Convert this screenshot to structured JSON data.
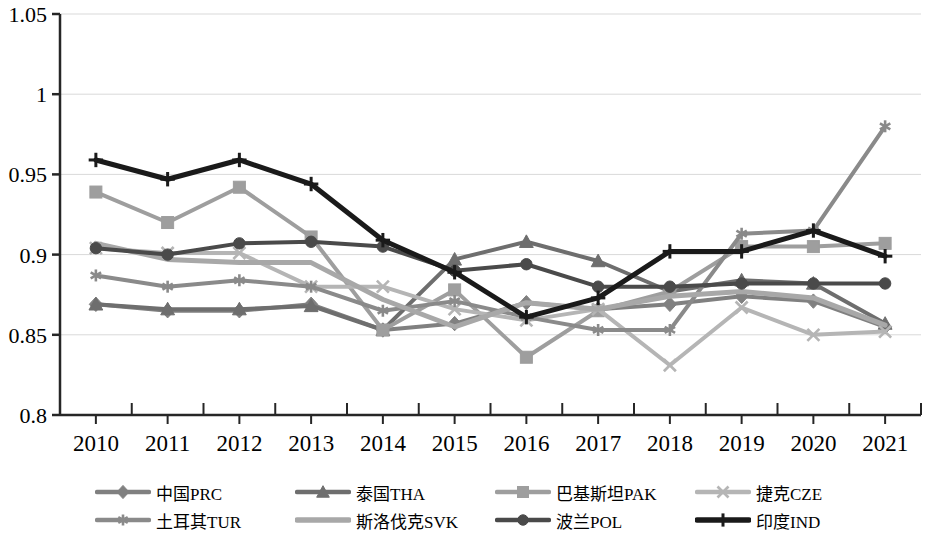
{
  "chart_data": {
    "type": "line",
    "title": "",
    "xlabel": "",
    "ylabel": "",
    "categories": [
      "2010",
      "2011",
      "2012",
      "2013",
      "2014",
      "2015",
      "2016",
      "2017",
      "2018",
      "2019",
      "2020",
      "2021"
    ],
    "ylim": [
      0.8,
      1.05
    ],
    "yticks": [
      "0.8",
      "0.85",
      "0.9",
      "0.95",
      "1",
      "1.05"
    ],
    "ytick_values": [
      0.8,
      0.85,
      0.9,
      0.95,
      1.0,
      1.05
    ],
    "grid": true,
    "legend_position": "bottom",
    "series": [
      {
        "name": "中国PRC",
        "marker": "diamond",
        "color": "#808080",
        "width": 4,
        "values": [
          0.869,
          0.865,
          0.865,
          0.869,
          0.853,
          0.857,
          0.87,
          0.866,
          0.869,
          0.874,
          0.871,
          0.855
        ]
      },
      {
        "name": "泰国THA",
        "marker": "triangle",
        "color": "#6e6e6e",
        "width": 4,
        "values": [
          0.869,
          0.866,
          0.866,
          0.868,
          0.853,
          0.897,
          0.908,
          0.896,
          0.877,
          0.884,
          0.882,
          0.857
        ]
      },
      {
        "name": "巴基斯坦PAK",
        "marker": "square",
        "color": "#9e9e9e",
        "width": 4,
        "values": [
          0.939,
          0.92,
          0.942,
          0.911,
          0.853,
          0.878,
          0.836,
          0.865,
          0.877,
          0.905,
          0.905,
          0.907
        ]
      },
      {
        "name": "捷克CZE",
        "marker": "x",
        "color": "#b5b5b5",
        "width": 4,
        "values": [
          0.904,
          0.901,
          0.901,
          0.88,
          0.88,
          0.866,
          0.859,
          0.866,
          0.831,
          0.867,
          0.85,
          0.852
        ]
      },
      {
        "name": "土耳其TUR",
        "marker": "asterisk",
        "color": "#8a8a8a",
        "width": 4,
        "values": [
          0.887,
          0.88,
          0.884,
          0.88,
          0.865,
          0.871,
          0.861,
          0.853,
          0.853,
          0.913,
          0.915,
          0.98
        ]
      },
      {
        "name": "斯洛伐克SVK",
        "marker": "none",
        "color": "#a8a8a8",
        "width": 5,
        "values": [
          0.907,
          0.897,
          0.895,
          0.895,
          0.872,
          0.855,
          0.87,
          0.866,
          0.874,
          0.877,
          0.873,
          0.856
        ]
      },
      {
        "name": "波兰POL",
        "marker": "circle",
        "color": "#4a4a4a",
        "width": 4,
        "values": [
          0.904,
          0.9,
          0.907,
          0.908,
          0.905,
          0.89,
          0.894,
          0.88,
          0.88,
          0.882,
          0.882,
          0.882
        ]
      },
      {
        "name": "印度IND",
        "marker": "plus",
        "color": "#1a1a1a",
        "width": 5,
        "values": [
          0.959,
          0.947,
          0.959,
          0.944,
          0.909,
          0.889,
          0.861,
          0.873,
          0.902,
          0.902,
          0.915,
          0.899
        ]
      }
    ]
  },
  "axis": {
    "y_labels": [
      "1.05",
      "1",
      "0.95",
      "0.9",
      "0.85",
      "0.8"
    ],
    "x_labels": [
      "2010",
      "2011",
      "2012",
      "2013",
      "2014",
      "2015",
      "2016",
      "2017",
      "2018",
      "2019",
      "2020",
      "2021"
    ]
  },
  "legend": {
    "items": [
      {
        "label": "中国PRC"
      },
      {
        "label": "泰国THA"
      },
      {
        "label": "巴基斯坦PAK"
      },
      {
        "label": "捷克CZE"
      },
      {
        "label": "土耳其TUR"
      },
      {
        "label": "斯洛伐克SVK"
      },
      {
        "label": "波兰POL"
      },
      {
        "label": "印度IND"
      }
    ]
  }
}
